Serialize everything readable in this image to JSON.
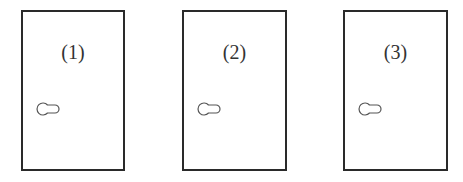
{
  "doors": [
    {
      "label": "(1)",
      "x": 21,
      "y": 10,
      "w": 104,
      "h": 161
    },
    {
      "label": "(2)",
      "x": 182,
      "y": 10,
      "w": 105,
      "h": 161
    },
    {
      "label": "(3)",
      "x": 343,
      "y": 10,
      "w": 105,
      "h": 161
    }
  ],
  "colors": {
    "stroke": "#2a2a2a",
    "knob": "#555555",
    "background": "#ffffff"
  }
}
